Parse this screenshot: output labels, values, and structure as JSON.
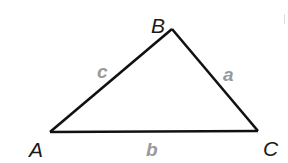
{
  "diagram": {
    "type": "triangle",
    "vertices": [
      {
        "id": "A",
        "label": "A"
      },
      {
        "id": "B",
        "label": "B"
      },
      {
        "id": "C",
        "label": "C"
      }
    ],
    "sides": [
      {
        "id": "c",
        "label": "c",
        "from": "A",
        "to": "B"
      },
      {
        "id": "a",
        "label": "a",
        "from": "B",
        "to": "C"
      },
      {
        "id": "b",
        "label": "b",
        "from": "A",
        "to": "C"
      }
    ],
    "colors": {
      "edge": "#111111",
      "vertex_label": "#1a1a1a",
      "side_label": "#9a9a9a",
      "background": "#ffffff"
    }
  }
}
